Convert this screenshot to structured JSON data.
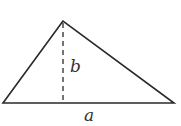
{
  "diagram": {
    "shape": "triangle",
    "labels": {
      "height": "b",
      "base": "a"
    },
    "colors": {
      "stroke": "#2a2a2a",
      "text": "#333333",
      "background": "#ffffff"
    }
  }
}
